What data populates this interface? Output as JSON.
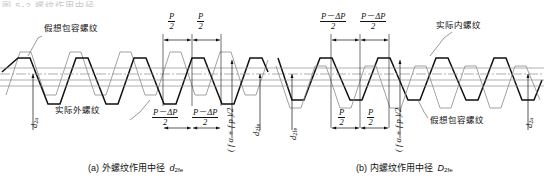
{
  "figure": {
    "top_cropped_text": "图 5-2 螺纹作用中径",
    "panels": [
      {
        "id": "a",
        "caption_prefix": "(a)",
        "caption_text": "外螺纹作用中径",
        "caption_symbol": "d",
        "caption_symbol_sub": "2fe",
        "annotations": {
          "envelope_thread": "假想包容螺纹",
          "actual_thread": "实际外螺纹"
        },
        "dim_top_left": {
          "num": "P",
          "den": "2"
        },
        "dim_top_right": {
          "num": "P",
          "den": "2"
        },
        "dim_bottom_left": {
          "num": "P－ΔP",
          "den": "2"
        },
        "dim_bottom_right": {
          "num": "P－ΔP",
          "den": "2"
        },
        "vertical_left_label": "d",
        "vertical_left_sub": "2a",
        "vertical_right_label": "d",
        "vertical_right_sub": "2fe",
        "vertical_mid_label": "( f α + f p )/2"
      },
      {
        "id": "b",
        "caption_prefix": "(b)",
        "caption_text": "内螺纹作用中径",
        "caption_symbol": "D",
        "caption_symbol_sub": "2fe",
        "annotations": {
          "actual_thread": "实际内螺纹",
          "envelope_thread": "假想包容螺纹"
        },
        "dim_top_left": {
          "num": "P－ΔP",
          "den": "2"
        },
        "dim_top_right": {
          "num": "P－ΔP",
          "den": "2"
        },
        "dim_bottom_left": {
          "num": "P",
          "den": "2"
        },
        "dim_bottom_right": {
          "num": "P",
          "den": "2"
        },
        "vertical_left_label": "d",
        "vertical_left_sub": "2fe",
        "vertical_right_label": "d",
        "vertical_right_sub": "2a",
        "vertical_mid_label": "( f α + f p )/2"
      }
    ],
    "colors": {
      "actual_thread_stroke": "#111111",
      "envelope_thread_stroke": "#7a7a7a",
      "axis_line": "#8c8c8c",
      "dim_line": "#111111",
      "background": "#ffffff"
    },
    "symbols": {
      "pitch": "P",
      "pitch_deviation": "ΔP",
      "angle_error": "fα",
      "pitch_error": "fp"
    }
  }
}
